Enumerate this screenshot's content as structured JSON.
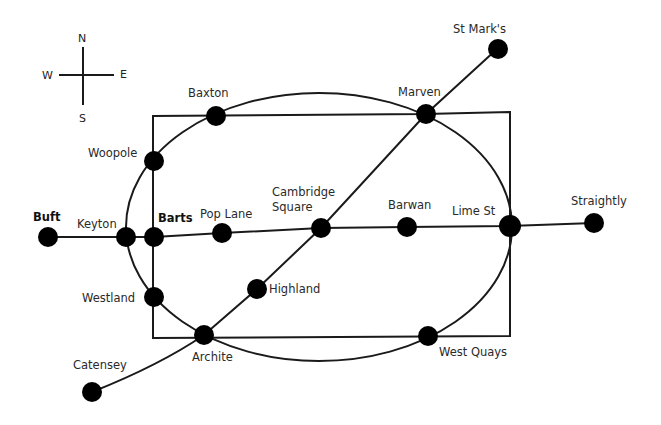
{
  "diagram": {
    "type": "metro-map",
    "background": "#ffffff",
    "line_color": "#1a1a1a",
    "station_color": "#000000"
  },
  "compass": {
    "north": "N",
    "south": "S",
    "east": "E",
    "west": "W"
  },
  "stations": {
    "buft": "Buft",
    "keyton": "Keyton",
    "barts": "Barts",
    "pop_lane": "Pop Lane",
    "cambridge_square_line1": "Cambridge",
    "cambridge_square_line2": "Square",
    "barwan": "Barwan",
    "lime_st": "Lime St",
    "straightly": "Straightly",
    "st_marks": "St Mark's",
    "marven": "Marven",
    "baxton": "Baxton",
    "woopole": "Woopole",
    "westland": "Westland",
    "highland": "Highland",
    "archite": "Archite",
    "catensey": "Catensey",
    "west_quays": "West Quays"
  },
  "lines": [
    {
      "name": "east-west-line",
      "stations": [
        "Buft",
        "Keyton",
        "Barts",
        "Pop Lane",
        "Cambridge Square",
        "Barwan",
        "Lime St",
        "Straightly"
      ]
    },
    {
      "name": "diagonal-line",
      "stations": [
        "Catensey",
        "Archite",
        "Highland",
        "Cambridge Square",
        "Marven",
        "St Mark's"
      ]
    },
    {
      "name": "circle-line",
      "stations": [
        "Baxton",
        "Marven",
        "Lime St",
        "West Quays",
        "Archite",
        "Westland",
        "Keyton",
        "Woopole"
      ]
    },
    {
      "name": "rectangle-line",
      "stations": [
        "Woopole",
        "Barts",
        "Westland",
        "Archite",
        "West Quays",
        "Lime St",
        "Marven",
        "Baxton"
      ]
    }
  ]
}
